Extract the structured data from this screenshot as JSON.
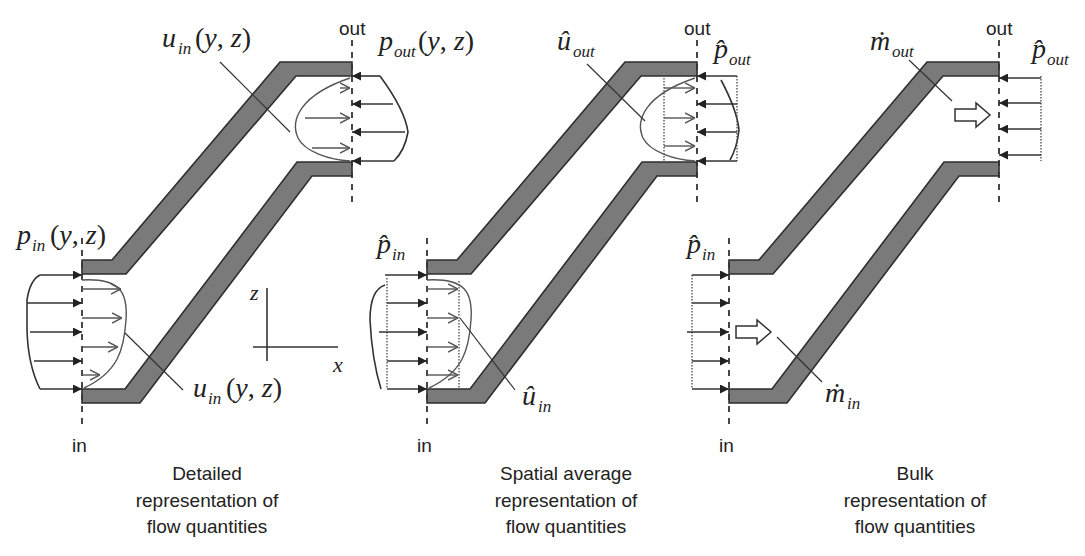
{
  "figure": {
    "panels": [
      {
        "id": "detailed",
        "caption": [
          "Detailed",
          "representation of",
          "flow quantities"
        ],
        "in_label": "in",
        "out_label": "out",
        "labels": {
          "p_in": {
            "sym": "p",
            "sub": "in",
            "args": "(y, z)"
          },
          "p_out": {
            "sym": "p",
            "sub": "out",
            "args": "(y, z)"
          },
          "u_in_top": {
            "sym": "u",
            "sub": "in",
            "args": "(y, z)"
          },
          "u_in_bottom": {
            "sym": "u",
            "sub": "in",
            "args": "(y, z)"
          }
        },
        "axes": {
          "x": "x",
          "z": "z"
        }
      },
      {
        "id": "spatial-average",
        "caption": [
          "Spatial average",
          "representation of",
          "flow quantities"
        ],
        "in_label": "in",
        "out_label": "out",
        "labels": {
          "p_in": {
            "sym": "p̂",
            "sub": "in"
          },
          "p_out": {
            "sym": "p̂",
            "sub": "out"
          },
          "u_out": {
            "sym": "û",
            "sub": "out"
          },
          "u_in": {
            "sym": "û",
            "sub": "in"
          }
        }
      },
      {
        "id": "bulk",
        "caption": [
          "Bulk",
          "representation of",
          "flow quantities"
        ],
        "in_label": "in",
        "out_label": "out",
        "labels": {
          "p_in": {
            "sym": "p̂",
            "sub": "in"
          },
          "p_out": {
            "sym": "p̂",
            "sub": "out"
          },
          "m_out": {
            "sym": "ṁ",
            "sub": "out"
          },
          "m_in": {
            "sym": "ṁ",
            "sub": "in"
          }
        }
      }
    ],
    "colors": {
      "wall_fill": "#7a7a7a",
      "wall_stroke": "#2e2e2e",
      "line": "#333333",
      "background": "#ffffff"
    }
  }
}
